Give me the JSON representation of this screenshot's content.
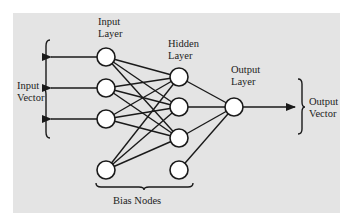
{
  "diagram": {
    "labels": {
      "input_layer": [
        "Input",
        "Layer"
      ],
      "hidden_layer": [
        "Hidden",
        "Layer"
      ],
      "output_layer": [
        "Output",
        "Layer"
      ],
      "input_vector": [
        "Input",
        "Vector"
      ],
      "output_vector": [
        "Output",
        "Vector"
      ],
      "bias_nodes": "Bias Nodes"
    },
    "layers": {
      "input": {
        "x": 106,
        "nodes_y": [
          57,
          88,
          119
        ],
        "bias_y": 170
      },
      "hidden": {
        "x": 179,
        "nodes_y": [
          77,
          107,
          138
        ],
        "bias_y": 170
      },
      "output": {
        "x": 234,
        "nodes_y": [
          107
        ]
      }
    },
    "node_radius": 9,
    "colors": {
      "background": "#e4e4e4",
      "stroke": "#1a1a1a",
      "node_fill": "#ffffff"
    }
  }
}
